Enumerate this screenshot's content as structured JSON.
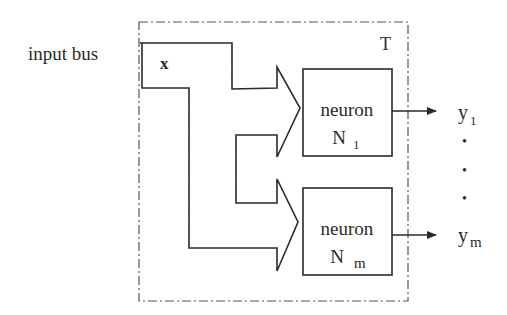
{
  "diagram": {
    "container_label": "T",
    "input_label": "input bus",
    "bus_symbol": "x",
    "neurons": [
      {
        "word": "neuron",
        "name": "N",
        "sub": "1",
        "output": "y",
        "output_sub": "1"
      },
      {
        "word": "neuron",
        "name": "N",
        "sub": "m",
        "output": "y",
        "output_sub": "m"
      }
    ],
    "ellipsis_dots": [
      "•",
      "•",
      "•"
    ],
    "colors": {
      "line": "#2a2a2a",
      "background": "#ffffff"
    }
  }
}
